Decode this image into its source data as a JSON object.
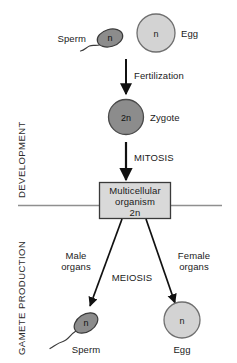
{
  "diagram": {
    "sections": [
      {
        "id": "development",
        "label": "DEVELOPMENT"
      },
      {
        "id": "gamete-production",
        "label": "GAMETE PRODUCTION"
      }
    ],
    "colors": {
      "background": "#ffffff",
      "sperm_fill": "#8c8c8c",
      "egg_fill": "#d3d3d3",
      "zygote_fill": "#8c8c8c",
      "box_fill": "#d9d9d9",
      "outline": "#3a3a3a",
      "text": "#111111",
      "divider": "#8f8f8f"
    },
    "top_row": {
      "sperm": {
        "label": "Sperm",
        "ploidy": "n"
      },
      "egg": {
        "label": "Egg",
        "ploidy": "n"
      }
    },
    "arrows": {
      "fertilization": {
        "label": "Fertilization"
      },
      "mitosis": {
        "label": "MITOSIS"
      },
      "meiosis": {
        "label": "MEIOSIS"
      }
    },
    "zygote": {
      "label": "Zygote",
      "ploidy": "2n"
    },
    "organism": {
      "line1": "Multicellular",
      "line2": "organism",
      "line3": "2n"
    },
    "organs": {
      "male": {
        "line1": "Male",
        "line2": "organs"
      },
      "female": {
        "line1": "Female",
        "line2": "organs"
      }
    },
    "bottom_row": {
      "sperm": {
        "label": "Sperm",
        "ploidy": "n"
      },
      "egg": {
        "label": "Egg",
        "ploidy": "n"
      }
    }
  }
}
